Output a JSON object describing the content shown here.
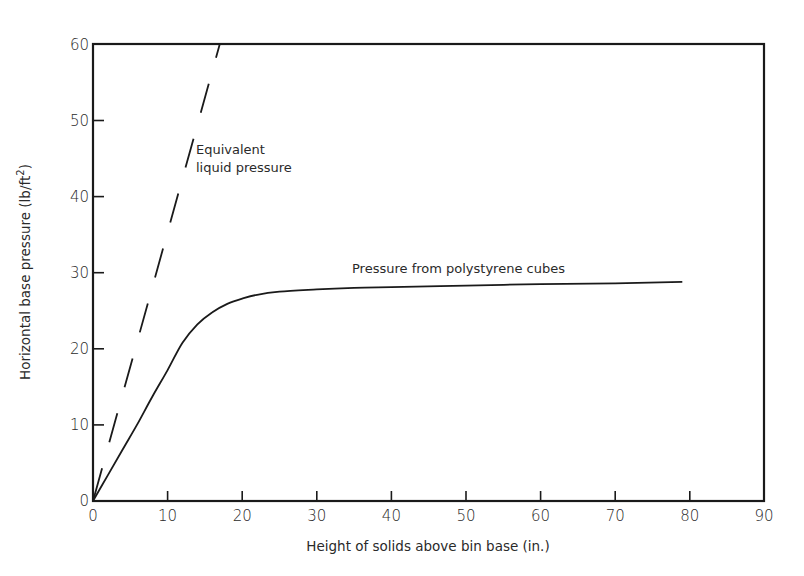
{
  "chart_data": {
    "type": "line",
    "title": "",
    "xlabel": "Height of solids above bin base (in.)",
    "ylabel": "Horizontal base pressure (lb/ft²)",
    "xlim": [
      0,
      90
    ],
    "ylim": [
      0,
      60
    ],
    "xticks": [
      0,
      10,
      20,
      30,
      40,
      50,
      60,
      70,
      80,
      90
    ],
    "yticks": [
      0,
      10,
      20,
      30,
      40,
      50,
      60
    ],
    "grid": false,
    "legend": "none (inline annotations)",
    "series": [
      {
        "name": "Pressure from polystyrene cubes",
        "style": "solid",
        "x": [
          0,
          2,
          4,
          6,
          8,
          10,
          12,
          14,
          16,
          18,
          20,
          22,
          25,
          30,
          35,
          40,
          50,
          60,
          70,
          79
        ],
        "y": [
          0,
          3.4,
          6.8,
          10.2,
          13.8,
          17.2,
          20.8,
          23.2,
          24.8,
          25.9,
          26.6,
          27.1,
          27.5,
          27.8,
          28.0,
          28.1,
          28.3,
          28.5,
          28.6,
          28.8
        ]
      },
      {
        "name": "Equivalent liquid pressure",
        "style": "dashed",
        "x": [
          0,
          17
        ],
        "y": [
          0,
          60
        ]
      }
    ],
    "annotations": [
      {
        "text": "Equivalent",
        "x": 14,
        "y": 46
      },
      {
        "text": "liquid pressure",
        "x": 14,
        "y": 43
      },
      {
        "text": "Pressure from polystyrene cubes",
        "x": 34.5,
        "y": 30.5
      }
    ]
  },
  "labels": {
    "x_axis": "Height of solids above bin base (in.)",
    "y_axis_main": "Horizontal base pressure (lb/ft",
    "y_axis_sup": "2",
    "y_axis_end": ")",
    "anno_liquid_1": "Equivalent",
    "anno_liquid_2": "liquid pressure",
    "anno_cubes": "Pressure from polystyrene cubes",
    "xt0": "0",
    "xt1": "10",
    "xt2": "20",
    "xt3": "30",
    "xt4": "40",
    "xt5": "50",
    "xt6": "60",
    "xt7": "70",
    "xt8": "80",
    "xt9": "90",
    "yt0": "0",
    "yt1": "10",
    "yt2": "20",
    "yt3": "30",
    "yt4": "40",
    "yt5": "50",
    "yt6": "60"
  }
}
